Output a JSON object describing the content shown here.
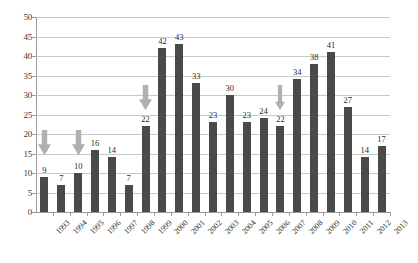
{
  "chart_data": {
    "type": "bar",
    "title": "",
    "subtitle": "",
    "xlabel": "",
    "ylabel": "",
    "categories": [
      "1993",
      "1994",
      "1995",
      "1996",
      "1997",
      "1998",
      "1999",
      "2000",
      "2001",
      "2002",
      "2003",
      "2004",
      "2005",
      "2006",
      "2007",
      "2008",
      "2009",
      "2010",
      "2011",
      "2012",
      "2013"
    ],
    "values": [
      9,
      7,
      10,
      16,
      14,
      7,
      22,
      42,
      43,
      33,
      23,
      30,
      23,
      24,
      22,
      34,
      38,
      41,
      27,
      14,
      17
    ],
    "data_labels": [
      "9",
      "7",
      "10",
      "16",
      "14",
      "7",
      "22",
      "42",
      "43",
      "33",
      "23",
      "30",
      "23",
      "24",
      "22",
      "34",
      "38",
      "41",
      "27",
      "14",
      "17"
    ],
    "ylim": [
      0,
      50
    ],
    "ytick_step": 5,
    "ytick_labels": [
      "0",
      "5",
      "10",
      "15",
      "20",
      "25",
      "30",
      "35",
      "40",
      "45",
      "50"
    ],
    "grid": "horizontal",
    "legend": "none",
    "bar_color": "#4a4a4a",
    "gridline_color": "#c8c8c8",
    "axis_color": "#9a9a9a",
    "annotations": [
      {
        "name": "arrow-1993",
        "category": "1993",
        "shape": "down-arrow",
        "color": "#b0b0b0",
        "top_value": 21,
        "bottom_value": 14.5,
        "width_px": 13
      },
      {
        "name": "arrow-1995",
        "category": "1995",
        "shape": "down-arrow",
        "color": "#b0b0b0",
        "top_value": 21,
        "bottom_value": 14.5,
        "width_px": 13
      },
      {
        "name": "arrow-1999",
        "category": "1999",
        "shape": "down-arrow",
        "color": "#b0b0b0",
        "top_value": 32.5,
        "bottom_value": 26,
        "width_px": 13
      },
      {
        "name": "arrow-2007",
        "category": "2007",
        "shape": "down-arrow",
        "color": "#b0b0b0",
        "top_value": 32.5,
        "bottom_value": 26,
        "width_px": 10
      }
    ]
  }
}
